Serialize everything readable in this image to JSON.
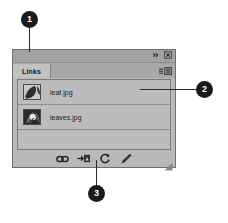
{
  "panel": {
    "title_bar": {
      "collapse_icon": "double-chevron-collapse-icon",
      "close_icon": "close-icon"
    },
    "tabs": [
      {
        "label": "Links",
        "active": true
      }
    ],
    "panel_menu_icon": "panel-flyout-menu-icon",
    "links": [
      {
        "name": "leaf.jpg",
        "thumbnail": "leaf-thumbnail"
      },
      {
        "name": "leaves.jpg",
        "thumbnail": "leaves-thumbnail"
      }
    ],
    "toolbar": [
      {
        "icon": "relink-chain-icon",
        "label": "Relink"
      },
      {
        "icon": "go-to-link-arrow-icon",
        "label": "Go To Link"
      },
      {
        "icon": "update-link-refresh-icon",
        "label": "Update Link"
      },
      {
        "icon": "edit-original-pencil-icon",
        "label": "Edit Original"
      }
    ],
    "resize_grip_icon": "resize-grip-icon"
  },
  "callouts": [
    {
      "number": "1"
    },
    {
      "number": "2"
    },
    {
      "number": "3"
    }
  ],
  "colors": {
    "panel_bg": "#b9b9b9",
    "title_bar": "#a2a2a2",
    "tab_active": "#c2c2c2",
    "list_bg": "#bcbcbc",
    "border": "#6f6f6f",
    "badge_bg": "#1a1a1a",
    "text": "#1a1a1a"
  }
}
